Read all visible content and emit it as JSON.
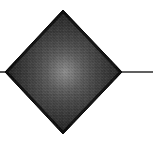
{
  "figure": {
    "title": "Dark diamond with central glow and horizontal axis line",
    "type": "natural-image",
    "canvas": {
      "width": 156,
      "height": 147,
      "background_color": "#ffffff"
    },
    "shapes": {
      "diamond": {
        "name": "Diamond",
        "center_x": 63,
        "center_y": 72,
        "left_vertex_x": 5,
        "right_vertex_x": 122,
        "top_vertex_y": 10,
        "bottom_vertex_y": 134,
        "half_width": 58,
        "half_height": 62,
        "edge_color": "#141414",
        "mid_color": "#2a2a2a",
        "glow_color": "#6e6e6e",
        "glow_center_x": 65,
        "glow_center_y": 72
      },
      "axis_line_right": {
        "name": "Horizontal line right",
        "start_x": 120,
        "end_x": 153,
        "y": 72,
        "thickness": 1.6,
        "color": "#2b2b2b"
      },
      "axis_line_left": {
        "name": "Horizontal line left stub",
        "start_x": 0,
        "end_x": 7,
        "y": 72,
        "thickness": 1.6,
        "color": "#2b2b2b"
      }
    },
    "texture": {
      "name": "block-noise",
      "description": "Fine blocky compression noise across the diamond",
      "opacity": 0.22,
      "cell_size": 3
    },
    "caption": ""
  }
}
